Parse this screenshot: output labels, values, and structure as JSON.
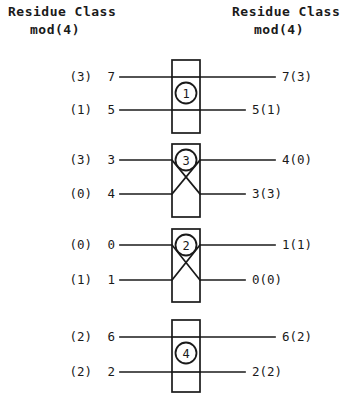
{
  "headers": {
    "left": {
      "line1": "Residue Class",
      "line2": "mod(4)"
    },
    "right": {
      "line1": "Residue Class",
      "line2": "mod(4)"
    }
  },
  "colors": {
    "ink": "#1a1a1a",
    "background": "#ffffff"
  },
  "diagram": {
    "type": "sorting-network",
    "comparator_count": 4,
    "wire_count": 8,
    "left_inputs": [
      {
        "residue_class": "(3)",
        "value": "7",
        "y": 77
      },
      {
        "residue_class": "(1)",
        "value": "5",
        "y": 110
      },
      {
        "residue_class": "(3)",
        "value": "3",
        "y": 160
      },
      {
        "residue_class": "(0)",
        "value": "4",
        "y": 194
      },
      {
        "residue_class": "(0)",
        "value": "0",
        "y": 245
      },
      {
        "residue_class": "(1)",
        "value": "1",
        "y": 280
      },
      {
        "residue_class": "(2)",
        "value": "6",
        "y": 337
      },
      {
        "residue_class": "(2)",
        "value": "2",
        "y": 372
      }
    ],
    "right_outputs": [
      {
        "label": "7(3)",
        "y": 77,
        "line_long": true
      },
      {
        "label": "5(1)",
        "y": 110,
        "line_long": false
      },
      {
        "label": "4(0)",
        "y": 160,
        "line_long": true
      },
      {
        "label": "3(3)",
        "y": 194,
        "line_long": false
      },
      {
        "label": "1(1)",
        "y": 245,
        "line_long": true
      },
      {
        "label": "0(0)",
        "y": 280,
        "line_long": false
      },
      {
        "label": "6(2)",
        "y": 337,
        "line_long": true
      },
      {
        "label": "2(2)",
        "y": 372,
        "line_long": false
      }
    ],
    "boxes": [
      {
        "badge": "1",
        "circled": "①",
        "x": 172,
        "y": 60,
        "w": 28,
        "h": 73,
        "swap": false,
        "top_line_y": 77,
        "bottom_line_y": 110
      },
      {
        "badge": "3",
        "circled": "③",
        "x": 172,
        "y": 144,
        "w": 28,
        "h": 73,
        "swap": true,
        "top_line_y": 160,
        "bottom_line_y": 194
      },
      {
        "badge": "2",
        "circled": "②",
        "x": 172,
        "y": 229,
        "w": 28,
        "h": 73,
        "swap": true,
        "top_line_y": 245,
        "bottom_line_y": 280
      },
      {
        "badge": "4",
        "circled": "④",
        "x": 172,
        "y": 320,
        "w": 28,
        "h": 72,
        "swap": false,
        "top_line_y": 337,
        "bottom_line_y": 372
      }
    ]
  }
}
